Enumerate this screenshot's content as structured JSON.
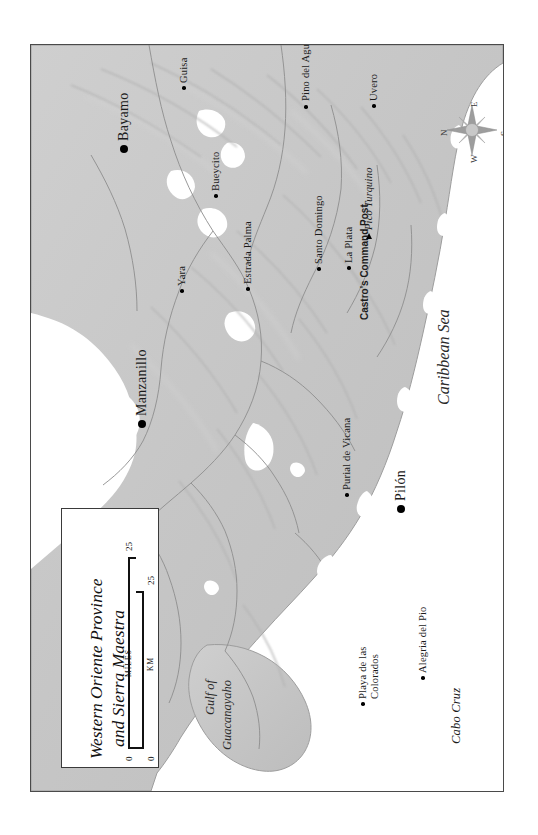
{
  "map": {
    "title_lines": [
      "Western Oriente Province",
      "and Sierra Maestra"
    ],
    "scale": {
      "miles_caption": "MILES",
      "km_caption": "KM",
      "miles_min": "0",
      "miles_max": "25",
      "km_min": "0",
      "km_max": "25"
    },
    "compass": {
      "north": "N",
      "east": "E",
      "south": "S",
      "west": "W"
    },
    "water_labels": [
      {
        "name": "caribbean-sea",
        "text": "Caribbean Sea"
      },
      {
        "name": "gulf-of-guacanayaho",
        "line1": "Gulf of",
        "line2": "Guacanayaho"
      }
    ],
    "capes": [
      {
        "name": "cabo-cruz",
        "text": "Cabo Cruz"
      }
    ],
    "peaks": [
      {
        "name": "pico-turquino",
        "text": "Pico Turquino"
      }
    ],
    "places": [
      {
        "name": "guisa",
        "text": "Guisa",
        "size": "small"
      },
      {
        "name": "bayamo",
        "text": "Bayamo",
        "size": "large"
      },
      {
        "name": "pino-del-agua",
        "text": "Pino del Agua",
        "size": "small"
      },
      {
        "name": "uvero",
        "text": "Uvero",
        "size": "small"
      },
      {
        "name": "bueycito",
        "text": "Bueycito",
        "size": "small"
      },
      {
        "name": "yara",
        "text": "Yara",
        "size": "small"
      },
      {
        "name": "estrada-palma",
        "text": "Estrada Palma",
        "size": "small"
      },
      {
        "name": "santo-domingo",
        "text": "Santo Domingo",
        "size": "small"
      },
      {
        "name": "la-plata",
        "text": "La Plata",
        "size": "small"
      },
      {
        "name": "castros-command-post",
        "text": "Castro's Command Post",
        "size": "none"
      },
      {
        "name": "manzanillo",
        "text": "Manzanillo",
        "size": "large"
      },
      {
        "name": "pilon",
        "text": "Pilón",
        "size": "large"
      },
      {
        "name": "purial-de-vicana",
        "text": "Purial de Vicana",
        "size": "small"
      },
      {
        "name": "playa-de-las-colorados",
        "text": "Playa de las",
        "text2": "Colorados",
        "size": "small"
      },
      {
        "name": "alegria-del-pio",
        "text": "Alegria del Pio",
        "size": "small"
      }
    ],
    "colors": {
      "land": "#c9c9c9",
      "land_edge": "#9a9a9a",
      "sea": "#ffffff",
      "neatline": "#4a4a4a",
      "text": "#1b1b1b"
    }
  }
}
